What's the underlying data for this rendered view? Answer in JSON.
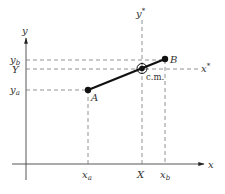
{
  "diagram": {
    "type": "center-of-mass coordinate diagram",
    "axes": {
      "x_label": "x",
      "y_label": "y",
      "x_star_label": "x*",
      "y_star_label": "y*"
    },
    "points": {
      "a_label": "A",
      "b_label": "B",
      "cm_label": "c.m."
    },
    "ticks": {
      "x": {
        "xa": "x",
        "xa_sub": "a",
        "X": "X",
        "xb": "x",
        "xb_sub": "b"
      },
      "y": {
        "yb": "y",
        "yb_sub": "b",
        "Y": "Y",
        "ya": "y",
        "ya_sub": "a"
      }
    },
    "colors": {
      "line": "#222222",
      "dash": "#666666",
      "text": "#333333"
    }
  }
}
